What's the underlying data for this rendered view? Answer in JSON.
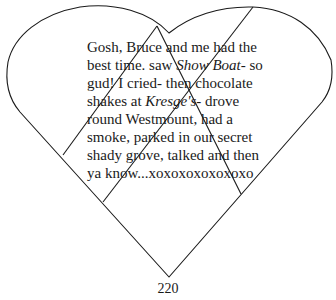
{
  "poem": {
    "lines": [
      {
        "parts": [
          {
            "text": "Gosh, Bruce and me had the",
            "italic": false
          }
        ]
      },
      {
        "parts": [
          {
            "text": "best time. saw ",
            "italic": false
          },
          {
            "text": "Show Boat",
            "italic": true
          },
          {
            "text": "- so",
            "italic": false
          }
        ]
      },
      {
        "parts": [
          {
            "text": "gud! I cried- then chocolate",
            "italic": false
          }
        ]
      },
      {
        "parts": [
          {
            "text": "shakes at ",
            "italic": false
          },
          {
            "text": "Kresge's",
            "italic": true
          },
          {
            "text": "- drove",
            "italic": false
          }
        ]
      },
      {
        "parts": [
          {
            "text": "round Westmount, had a",
            "italic": false
          }
        ]
      },
      {
        "parts": [
          {
            "text": "smoke, parked in our secret",
            "italic": false
          }
        ]
      },
      {
        "parts": [
          {
            "text": "shady grove, talked and then",
            "italic": false
          }
        ]
      },
      {
        "parts": [
          {
            "text": "ya know...xoxoxoxoxoxoxo",
            "italic": false
          }
        ]
      }
    ]
  },
  "figure": {
    "shape": "heart",
    "stroke_color": "#1a1a1a",
    "fill_color": "#ffffff"
  },
  "page_number": "220"
}
